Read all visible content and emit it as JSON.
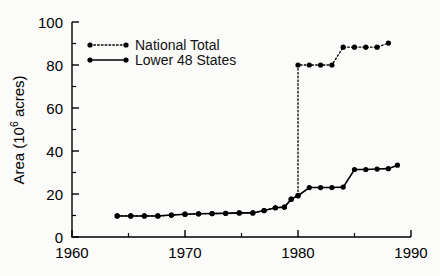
{
  "chart_data": {
    "type": "line",
    "title": "",
    "xlabel": "",
    "ylabel": "Area (10⁶ acres)",
    "ylabel_parts": {
      "prefix": "Area (10",
      "exponent": "6",
      "suffix": " acres)"
    },
    "xlim": [
      1960,
      1990
    ],
    "ylim": [
      0,
      100
    ],
    "x_ticks": [
      1960,
      1970,
      1980,
      1990
    ],
    "x_ticks_minor": [
      1965,
      1975,
      1985
    ],
    "y_ticks": [
      0,
      20,
      40,
      60,
      80,
      100
    ],
    "y_ticks_minor": [
      10,
      30,
      50,
      70,
      90
    ],
    "grid": false,
    "legend_position": "upper-left-inside",
    "series": [
      {
        "name": "National Total",
        "style": "dotted",
        "marker": "filled-circle",
        "color": "#000000",
        "points": [
          {
            "x": 1964.0,
            "y": 9.8
          },
          {
            "x": 1965.2,
            "y": 9.8
          },
          {
            "x": 1966.4,
            "y": 9.8
          },
          {
            "x": 1967.6,
            "y": 9.8
          },
          {
            "x": 1968.8,
            "y": 10.2
          },
          {
            "x": 1970.0,
            "y": 10.6
          },
          {
            "x": 1971.2,
            "y": 10.8
          },
          {
            "x": 1972.4,
            "y": 10.9
          },
          {
            "x": 1973.6,
            "y": 11.0
          },
          {
            "x": 1974.8,
            "y": 11.2
          },
          {
            "x": 1976.0,
            "y": 11.2
          },
          {
            "x": 1977.0,
            "y": 12.3
          },
          {
            "x": 1978.0,
            "y": 13.6
          },
          {
            "x": 1978.8,
            "y": 13.9
          },
          {
            "x": 1979.4,
            "y": 17.6
          },
          {
            "x": 1980.0,
            "y": 19.2
          },
          {
            "x": 1980.0,
            "y": 80.0
          },
          {
            "x": 1981.0,
            "y": 80.0
          },
          {
            "x": 1982.0,
            "y": 80.0
          },
          {
            "x": 1983.0,
            "y": 80.0
          },
          {
            "x": 1984.0,
            "y": 88.3
          },
          {
            "x": 1985.0,
            "y": 88.3
          },
          {
            "x": 1986.0,
            "y": 88.3
          },
          {
            "x": 1987.0,
            "y": 88.3
          },
          {
            "x": 1988.0,
            "y": 90.2
          }
        ]
      },
      {
        "name": "Lower 48 States",
        "style": "solid",
        "marker": "filled-circle",
        "color": "#000000",
        "points": [
          {
            "x": 1964.0,
            "y": 9.8
          },
          {
            "x": 1965.2,
            "y": 9.8
          },
          {
            "x": 1966.4,
            "y": 9.8
          },
          {
            "x": 1967.6,
            "y": 9.8
          },
          {
            "x": 1968.8,
            "y": 10.2
          },
          {
            "x": 1970.0,
            "y": 10.6
          },
          {
            "x": 1971.2,
            "y": 10.8
          },
          {
            "x": 1972.4,
            "y": 10.9
          },
          {
            "x": 1973.6,
            "y": 11.0
          },
          {
            "x": 1974.8,
            "y": 11.2
          },
          {
            "x": 1976.0,
            "y": 11.2
          },
          {
            "x": 1977.0,
            "y": 12.3
          },
          {
            "x": 1978.0,
            "y": 13.6
          },
          {
            "x": 1978.8,
            "y": 13.9
          },
          {
            "x": 1979.4,
            "y": 17.6
          },
          {
            "x": 1980.0,
            "y": 19.2
          },
          {
            "x": 1981.0,
            "y": 23.0
          },
          {
            "x": 1982.0,
            "y": 23.0
          },
          {
            "x": 1983.0,
            "y": 23.0
          },
          {
            "x": 1984.0,
            "y": 23.2
          },
          {
            "x": 1985.0,
            "y": 31.4
          },
          {
            "x": 1986.0,
            "y": 31.4
          },
          {
            "x": 1987.0,
            "y": 31.6
          },
          {
            "x": 1988.0,
            "y": 31.8
          },
          {
            "x": 1988.8,
            "y": 33.4
          }
        ]
      }
    ]
  },
  "legend": {
    "items": [
      {
        "label": "National Total",
        "style": "dotted"
      },
      {
        "label": "Lower 48 States",
        "style": "solid"
      }
    ]
  },
  "colors": {
    "foreground": "#000000",
    "background": "#fbfbfa"
  }
}
